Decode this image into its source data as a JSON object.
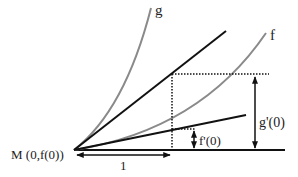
{
  "diagram": {
    "type": "tangent-slope-illustration",
    "colors": {
      "tangent_line": "#111111",
      "curve": "#8a8a8a",
      "guide": "#111111",
      "text": "#222222"
    },
    "labels": {
      "origin": "M (0,f(0))",
      "unit": "1",
      "curve_g": "g",
      "curve_f": "f",
      "slope_g": "g'(0)",
      "slope_f": "f'(0)"
    }
  }
}
